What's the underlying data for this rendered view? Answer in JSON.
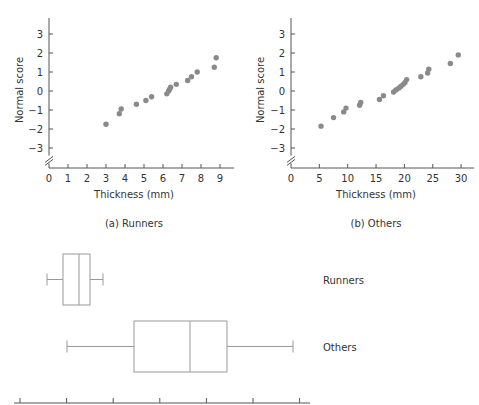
{
  "colors": {
    "axis": "#555555",
    "point": "#8a8a8a",
    "box": "#999999",
    "text": "#333333"
  },
  "chart_data": [
    {
      "id": "runners_normal",
      "type": "scatter",
      "title": "(a) Runners",
      "xlabel": "Thickness (mm)",
      "ylabel": "Normal score",
      "xlim": [
        0,
        9
      ],
      "ylim": [
        -3,
        3
      ],
      "xticks": [
        0,
        1,
        2,
        3,
        4,
        5,
        6,
        7,
        8,
        9
      ],
      "yticks": [
        -3,
        -2,
        -1,
        0,
        1,
        2,
        3
      ],
      "grid": false,
      "axis_break": true,
      "points": [
        [
          3.0,
          -1.75
        ],
        [
          3.7,
          -1.2
        ],
        [
          3.8,
          -0.95
        ],
        [
          4.6,
          -0.7
        ],
        [
          5.1,
          -0.5
        ],
        [
          5.4,
          -0.3
        ],
        [
          6.2,
          -0.15
        ],
        [
          6.3,
          0.0
        ],
        [
          6.35,
          0.1
        ],
        [
          6.4,
          0.2
        ],
        [
          6.7,
          0.35
        ],
        [
          7.3,
          0.55
        ],
        [
          7.5,
          0.75
        ],
        [
          7.8,
          1.0
        ],
        [
          8.7,
          1.25
        ],
        [
          8.8,
          1.75
        ]
      ]
    },
    {
      "id": "others_normal",
      "type": "scatter",
      "title": "(b) Others",
      "xlabel": "Thickness (mm)",
      "ylabel": "Normal score",
      "xlim": [
        0,
        30
      ],
      "ylim": [
        -3,
        3
      ],
      "xticks": [
        0,
        5,
        10,
        15,
        20,
        25,
        30
      ],
      "yticks": [
        -3,
        -2,
        -1,
        0,
        1,
        2,
        3
      ],
      "grid": false,
      "axis_break": true,
      "points": [
        [
          5.3,
          -1.85
        ],
        [
          7.5,
          -1.4
        ],
        [
          9.3,
          -1.1
        ],
        [
          9.7,
          -0.9
        ],
        [
          12.1,
          -0.75
        ],
        [
          12.3,
          -0.6
        ],
        [
          15.6,
          -0.45
        ],
        [
          16.3,
          -0.25
        ],
        [
          18.1,
          -0.05
        ],
        [
          18.5,
          0.05
        ],
        [
          19.0,
          0.15
        ],
        [
          19.4,
          0.25
        ],
        [
          19.8,
          0.35
        ],
        [
          20.1,
          0.45
        ],
        [
          20.4,
          0.6
        ],
        [
          22.9,
          0.75
        ],
        [
          24.1,
          0.95
        ],
        [
          24.3,
          1.15
        ],
        [
          28.1,
          1.45
        ],
        [
          29.5,
          1.9
        ]
      ]
    },
    {
      "id": "boxplots",
      "type": "box",
      "xlabel": "",
      "tick_labels_visible": false,
      "axis_range_px": [
        14,
        310
      ],
      "tick_count": 7,
      "series": [
        {
          "name": "Runners",
          "whisker_low_px": 47,
          "q1_px": 63,
          "median_px": 79,
          "q3_px": 90,
          "whisker_high_px": 103,
          "approx_mm": {
            "min": 3.0,
            "q1": 4.6,
            "median": 6.3,
            "q3": 7.5,
            "max": 8.8
          }
        },
        {
          "name": "Others",
          "whisker_low_px": 67,
          "q1_px": 134,
          "median_px": 190,
          "q3_px": 227,
          "whisker_high_px": 293,
          "approx_mm": {
            "min": 5.3,
            "q1": 12.3,
            "median": 18.8,
            "q3": 22.9,
            "max": 29.5
          }
        }
      ]
    }
  ],
  "labels": {
    "runners_caption": "(a) Runners",
    "others_caption": "(b) Others",
    "xlabel": "Thickness (mm)",
    "ylabel": "Normal score",
    "box_runners": "Runners",
    "box_others": "Others"
  }
}
